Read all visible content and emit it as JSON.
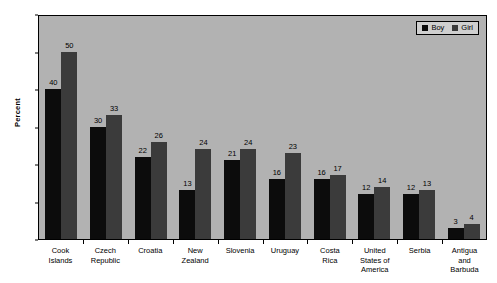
{
  "chart_data": {
    "type": "bar",
    "title": "",
    "xlabel": "",
    "ylabel": "Percent",
    "ylim": [
      0,
      60
    ],
    "yticks": [
      0,
      10,
      20,
      30,
      40,
      50,
      60
    ],
    "grid": false,
    "legend_position": "top-right",
    "categories": [
      "Cook Islands",
      "Czech Republic",
      "Croatia",
      "New Zealand",
      "Slovenia",
      "Uruguay",
      "Costa Rica",
      "United States of America",
      "Serbia",
      "Antigua and Barbuda"
    ],
    "category_lines": [
      [
        "Cook",
        "Islands"
      ],
      [
        "Czech",
        "Republic"
      ],
      [
        "Croatia"
      ],
      [
        "New",
        "Zealand"
      ],
      [
        "Slovenia"
      ],
      [
        "Uruguay"
      ],
      [
        "Costa",
        "Rica"
      ],
      [
        "United",
        "States of",
        "America"
      ],
      [
        "Serbia"
      ],
      [
        "Antigua",
        "and",
        "Barbuda"
      ]
    ],
    "series": [
      {
        "name": "Boy",
        "color": "#0c0c0c",
        "values": [
          40,
          30,
          22,
          13,
          21,
          16,
          16,
          12,
          12,
          3
        ]
      },
      {
        "name": "Girl",
        "color": "#3b3b3b",
        "values": [
          50,
          33,
          26,
          24,
          24,
          23,
          17,
          14,
          13,
          4
        ]
      }
    ]
  },
  "colors": {
    "plot_background": "#b2b2b2",
    "page_background": "#ffffff",
    "axis": "#000000",
    "legend_background": "#cfcfcf"
  }
}
